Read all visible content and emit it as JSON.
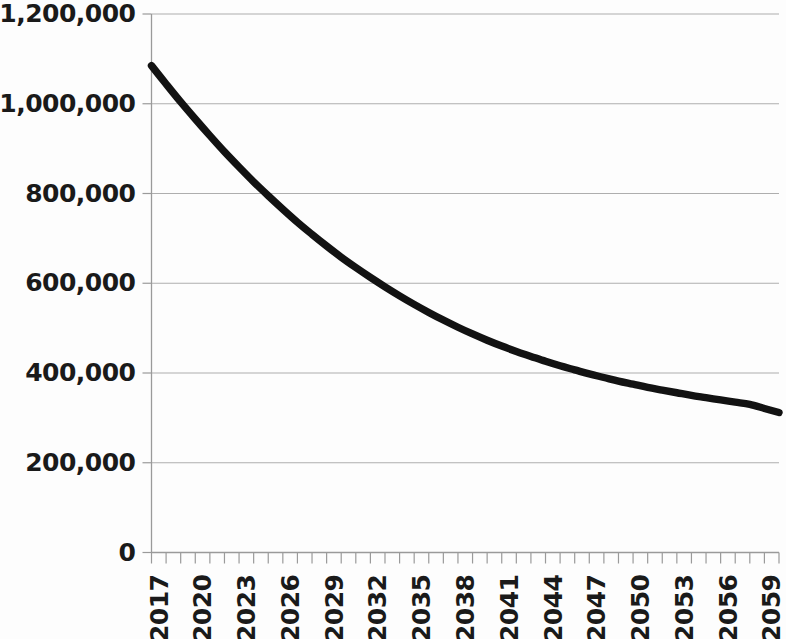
{
  "chart_data": {
    "type": "line",
    "title": "",
    "subtitle": "",
    "xlabel": "",
    "ylabel": "",
    "grid": true,
    "legend": false,
    "legend_position": "none",
    "line_color": "#121212",
    "gridline_color": "#aeaeae",
    "background_color": "#fdfdfd",
    "xlim": [
      2017,
      2060
    ],
    "ylim": [
      0,
      1200000
    ],
    "y_ticks": [
      0,
      200000,
      400000,
      600000,
      800000,
      1000000,
      1200000
    ],
    "y_tick_labels": [
      "0",
      "200,000",
      "400,000",
      "600,000",
      "800,000",
      "1,000,000",
      "1,200,000"
    ],
    "x_tick_labels": [
      "2017",
      "2020",
      "2023",
      "2026",
      "2029",
      "2032",
      "2035",
      "2038",
      "2041",
      "2044",
      "2047",
      "2050",
      "2053",
      "2056",
      "2059"
    ],
    "x_tick_label_step": 3,
    "x_minor_tick_step": 1,
    "x": [
      2017,
      2018,
      2019,
      2020,
      2021,
      2022,
      2023,
      2024,
      2025,
      2026,
      2027,
      2028,
      2029,
      2030,
      2031,
      2032,
      2033,
      2034,
      2035,
      2036,
      2037,
      2038,
      2039,
      2040,
      2041,
      2042,
      2043,
      2044,
      2045,
      2046,
      2047,
      2048,
      2049,
      2050,
      2051,
      2052,
      2053,
      2054,
      2055,
      2056,
      2057,
      2058,
      2059,
      2060
    ],
    "series": [
      {
        "name": "Projection",
        "values": [
          1085000,
          1044000,
          1004000,
          966000,
          929000,
          893000,
          859000,
          826000,
          795000,
          765000,
          736000,
          709000,
          683000,
          658000,
          635000,
          613000,
          592000,
          572000,
          553000,
          535000,
          518000,
          502000,
          487000,
          473000,
          460000,
          448000,
          437000,
          426000,
          416000,
          407000,
          398000,
          390000,
          382000,
          375000,
          368000,
          362000,
          356000,
          350000,
          345000,
          340000,
          335000,
          330000,
          321000,
          312000
        ]
      }
    ],
    "annotations": []
  }
}
